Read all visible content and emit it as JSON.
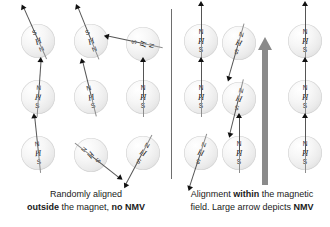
{
  "figure": {
    "divider_name": "panel-divider",
    "colors": {
      "sphere_fill": "#efefef",
      "sphere_edge": "#d2d2d2",
      "vector_arrow": "#111111",
      "vector_shaft": "#555555",
      "nmv_arrow": "#8a8a8a",
      "text": "#1a1a1a",
      "background": "#ffffff"
    }
  },
  "pole_labels": {
    "north": "N",
    "south": "S",
    "nucleus": "H"
  },
  "left_panel": {
    "name": "randomly-aligned-panel",
    "caption": {
      "line1_plain": "Randomly aligned",
      "line2_pre": "",
      "line2_bold1": "outside",
      "line2_mid": " the magnet, ",
      "line2_bold2": "no NMV",
      "line2_post": ""
    },
    "protons": [
      {
        "id": "L-r1c1",
        "x": 21,
        "y": 24,
        "rotation": -24,
        "arrow": "down-left",
        "poles": [
          "S",
          "H",
          "N"
        ]
      },
      {
        "id": "L-r1c2",
        "x": 74,
        "y": 24,
        "rotation": -22,
        "arrow": "down-left",
        "poles": [
          "S",
          "H",
          "N"
        ]
      },
      {
        "id": "L-r1c3",
        "x": 126,
        "y": 27,
        "rotation": -78,
        "arrow": "up-right",
        "poles": [
          "S",
          "H",
          "N"
        ]
      },
      {
        "id": "L-r2c1",
        "x": 21,
        "y": 80,
        "rotation": 4,
        "arrow": "up",
        "poles": [
          "N",
          "H",
          "S"
        ]
      },
      {
        "id": "L-r2c2",
        "x": 74,
        "y": 80,
        "rotation": -14,
        "arrow": "up-left",
        "poles": [
          "N",
          "H",
          "S"
        ]
      },
      {
        "id": "L-r2c3",
        "x": 126,
        "y": 80,
        "rotation": 0,
        "arrow": "up",
        "poles": [
          "N",
          "H",
          "S"
        ]
      },
      {
        "id": "L-r3c1",
        "x": 21,
        "y": 136,
        "rotation": -6,
        "arrow": "up",
        "poles": [
          "N",
          "H",
          "S"
        ]
      },
      {
        "id": "L-r3c2",
        "x": 74,
        "y": 138,
        "rotation": 128,
        "arrow": "down-right",
        "poles": [
          "S",
          "H",
          "N"
        ]
      },
      {
        "id": "L-r3c3",
        "x": 126,
        "y": 136,
        "rotation": 208,
        "arrow": "down-left",
        "poles": [
          "S",
          "H",
          "N"
        ]
      }
    ]
  },
  "right_panel": {
    "name": "aligned-in-field-panel",
    "caption": {
      "line1_pre": "Alignment ",
      "line1_bold": "within",
      "line1_post": " the magnetic",
      "line2_pre": "field. Large arrow depicts ",
      "line2_bold": "NMV",
      "line2_post": ""
    },
    "nmv_arrow": {
      "name": "nmv-arrow",
      "direction": "up",
      "meaning": "NMV"
    },
    "protons": [
      {
        "id": "R-r1c1",
        "x": 184,
        "y": 24,
        "rotation": 0,
        "arrow": "up",
        "poles": [
          "N",
          "H",
          "S"
        ]
      },
      {
        "id": "R-r1c2",
        "x": 222,
        "y": 26,
        "rotation": 196,
        "arrow": "down-left",
        "poles": [
          "S",
          "H",
          "N"
        ]
      },
      {
        "id": "R-r1c3",
        "x": 288,
        "y": 24,
        "rotation": 0,
        "arrow": "up",
        "poles": [
          "N",
          "H",
          "S"
        ]
      },
      {
        "id": "R-r2c1",
        "x": 184,
        "y": 80,
        "rotation": 0,
        "arrow": "up",
        "poles": [
          "N",
          "H",
          "S"
        ]
      },
      {
        "id": "R-r2c2",
        "x": 222,
        "y": 82,
        "rotation": 194,
        "arrow": "down-right",
        "poles": [
          "S",
          "H",
          "N"
        ]
      },
      {
        "id": "R-r2c3",
        "x": 288,
        "y": 80,
        "rotation": 0,
        "arrow": "up",
        "poles": [
          "N",
          "H",
          "S"
        ]
      },
      {
        "id": "R-r3c1",
        "x": 184,
        "y": 136,
        "rotation": 198,
        "arrow": "down-left",
        "poles": [
          "S",
          "H",
          "N"
        ]
      },
      {
        "id": "R-r3c2",
        "x": 222,
        "y": 136,
        "rotation": 0,
        "arrow": "up",
        "poles": [
          "N",
          "H",
          "S"
        ]
      },
      {
        "id": "R-r3c3",
        "x": 288,
        "y": 136,
        "rotation": 0,
        "arrow": "up",
        "poles": [
          "N",
          "H",
          "S"
        ]
      }
    ]
  }
}
